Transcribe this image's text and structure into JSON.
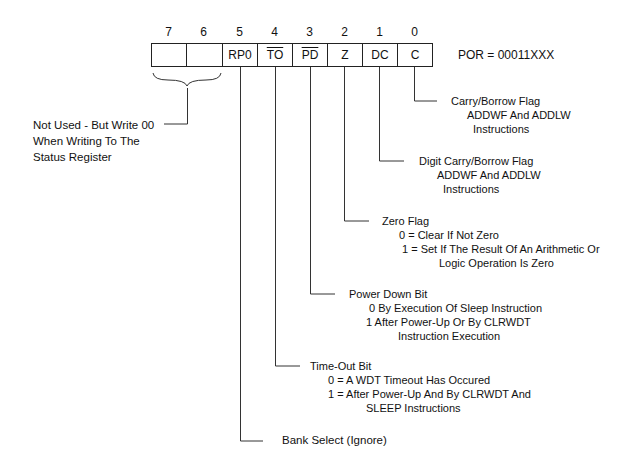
{
  "register": {
    "bit_numbers": [
      "7",
      "6",
      "5",
      "4",
      "3",
      "2",
      "1",
      "0"
    ],
    "bits": [
      {
        "label": "",
        "overline": false
      },
      {
        "label": "",
        "overline": false
      },
      {
        "label": "RP0",
        "overline": false
      },
      {
        "label": "TO",
        "overline": true
      },
      {
        "label": "PD",
        "overline": true
      },
      {
        "label": "Z",
        "overline": false
      },
      {
        "label": "DC",
        "overline": false
      },
      {
        "label": "C",
        "overline": false
      }
    ],
    "por": "POR = 00011XXX"
  },
  "descriptions": {
    "unused": [
      "Not Used - But Write 00",
      "When Writing To The",
      "Status  Register"
    ],
    "c": [
      "Carry/Borrow Flag",
      "ADDWF And ADDLW",
      "Instructions"
    ],
    "dc": [
      "Digit Carry/Borrow Flag",
      "ADDWF And ADDLW",
      "Instructions"
    ],
    "z": [
      "Zero Flag",
      "0 = Clear If Not Zero",
      "1 = Set If The Result Of An Arithmetic Or",
      "Logic Operation Is Zero"
    ],
    "pd": [
      "Power Down Bit",
      "0  By Execution Of Sleep Instruction",
      "1  After Power-Up Or By CLRWDT",
      "Instruction Execution"
    ],
    "to": [
      "Time-Out Bit",
      "0 = A WDT Timeout Has Occured",
      "1 = After Power-Up And By CLRWDT And",
      "SLEEP Instructions"
    ],
    "rp0": [
      "Bank Select (Ignore)"
    ]
  }
}
